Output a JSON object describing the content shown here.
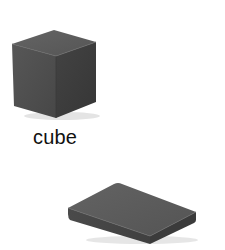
{
  "scene": {
    "background": "#ffffff",
    "objects": [
      {
        "name": "cube",
        "colors": {
          "top": "#5a5a5a",
          "left": "#4e4e4e",
          "right": "#3f3f3f",
          "shadow": "#d8d8d8"
        }
      },
      {
        "name": "rectangular-block",
        "colors": {
          "top": "#5c5c5c",
          "front": "#474747",
          "side": "#3c3c3c",
          "shadow": "#dddddd"
        }
      }
    ],
    "label": {
      "text": "cube",
      "color": "#111111"
    }
  }
}
